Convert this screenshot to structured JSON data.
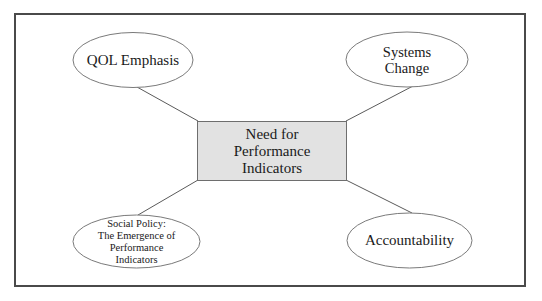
{
  "diagram": {
    "type": "hub-and-spoke concept map",
    "colors": {
      "frame_border": "#4a4a4a",
      "center_fill": "#e2e2e2",
      "center_border": "#6e6e6e",
      "ellipse_fill": "#ffffff",
      "ellipse_border": "#7a7a7a",
      "connector": "#5a5a5a",
      "text": "#1a1a1a"
    },
    "center": {
      "lines": [
        "Need for",
        "Performance",
        "Indicators"
      ]
    },
    "nodes": [
      {
        "id": "qol-emphasis",
        "position": "top-left",
        "lines": [
          "QOL Emphasis"
        ]
      },
      {
        "id": "systems-change",
        "position": "top-right",
        "lines": [
          "Systems",
          "Change"
        ]
      },
      {
        "id": "social-policy",
        "position": "bottom-left",
        "lines": [
          "Social Policy:",
          "The Emergence of",
          "Performance",
          "Indicators"
        ]
      },
      {
        "id": "accountability",
        "position": "bottom-right",
        "lines": [
          "Accountability"
        ]
      }
    ],
    "edges": [
      {
        "from": "center",
        "to": "qol-emphasis"
      },
      {
        "from": "center",
        "to": "systems-change"
      },
      {
        "from": "center",
        "to": "social-policy"
      },
      {
        "from": "center",
        "to": "accountability"
      }
    ]
  }
}
